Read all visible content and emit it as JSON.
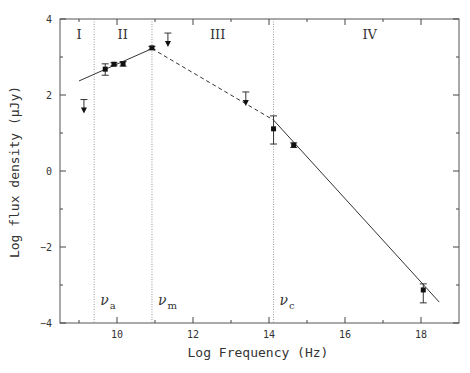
{
  "chart_data": {
    "type": "line",
    "title": "",
    "xlabel": "Log Frequency (Hz)",
    "ylabel": "Log flux density (μJy)",
    "xlim": [
      8.5,
      19
    ],
    "ylim": [
      -4,
      4
    ],
    "grid": false,
    "x_major_ticks": [
      10,
      12,
      14,
      16,
      18
    ],
    "x_minor_ticks": [
      9,
      11,
      13,
      15,
      17
    ],
    "y_major_ticks": [
      -4,
      -2,
      0,
      2,
      4
    ],
    "y_minor_ticks": [
      -3,
      -1,
      1,
      3
    ],
    "vertical_markers": [
      {
        "x": 9.4,
        "label": "ν",
        "sub": "a"
      },
      {
        "x": 10.92,
        "label": "ν",
        "sub": "m"
      },
      {
        "x": 14.12,
        "label": "ν",
        "sub": "c"
      }
    ],
    "regions": [
      {
        "label": "I",
        "x": 9.0
      },
      {
        "label": "II",
        "x": 10.15
      },
      {
        "label": "III",
        "x": 12.65
      },
      {
        "label": "IV",
        "x": 16.65
      }
    ],
    "model_segments": [
      {
        "style": "solid",
        "points": [
          [
            9.0,
            2.37
          ],
          [
            10.92,
            3.22
          ]
        ]
      },
      {
        "style": "dashed",
        "points": [
          [
            10.92,
            3.22
          ],
          [
            14.12,
            1.34
          ]
        ]
      },
      {
        "style": "solid",
        "points": [
          [
            14.12,
            1.34
          ],
          [
            18.48,
            -3.45
          ]
        ]
      }
    ],
    "series": [
      {
        "name": "detections",
        "points": [
          {
            "x": 9.69,
            "y": 2.68,
            "yerr_low": 2.52,
            "yerr_high": 2.82
          },
          {
            "x": 9.92,
            "y": 2.81,
            "yerr_low": 2.77,
            "yerr_high": 2.85
          },
          {
            "x": 10.16,
            "y": 2.82,
            "yerr_low": 2.76,
            "yerr_high": 2.88
          },
          {
            "x": 10.92,
            "y": 3.24,
            "yerr_low": 3.2,
            "yerr_high": 3.28
          },
          {
            "x": 14.12,
            "y": 1.11,
            "yerr_low": 0.71,
            "yerr_high": 1.45
          },
          {
            "x": 14.65,
            "y": 0.68,
            "yerr_low": 0.62,
            "yerr_high": 0.74
          },
          {
            "x": 18.06,
            "y": -3.13,
            "yerr_low": -3.47,
            "yerr_high": -2.97
          }
        ]
      },
      {
        "name": "upper_limits",
        "points": [
          {
            "x": 9.13,
            "y": 1.88
          },
          {
            "x": 11.34,
            "y": 3.63
          },
          {
            "x": 13.39,
            "y": 2.08
          }
        ]
      }
    ]
  },
  "axes": {
    "xlabel": "Log Frequency (Hz)",
    "ylabel": "Log flux density (μJy)"
  }
}
